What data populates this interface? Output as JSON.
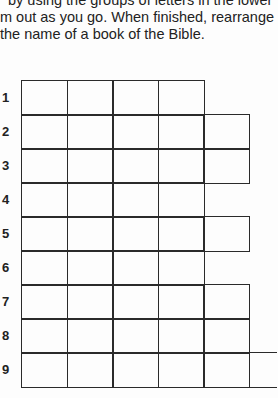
{
  "instructions": {
    "lines": [
      "by using the groups of letters in the lower",
      "m out as you go. When finished, rearrange",
      "the name of a book of the Bible."
    ]
  },
  "grid": {
    "rows": [
      {
        "label": "1",
        "cells": 4
      },
      {
        "label": "2",
        "cells": 5
      },
      {
        "label": "3",
        "cells": 5
      },
      {
        "label": "4",
        "cells": 4
      },
      {
        "label": "5",
        "cells": 5
      },
      {
        "label": "6",
        "cells": 4
      },
      {
        "label": "7",
        "cells": 5
      },
      {
        "label": "8",
        "cells": 5
      },
      {
        "label": "9",
        "cells": 6
      }
    ]
  }
}
